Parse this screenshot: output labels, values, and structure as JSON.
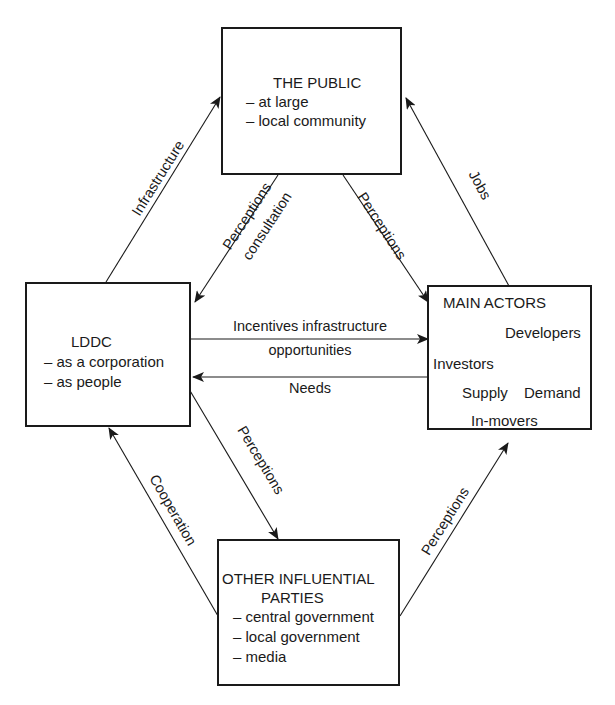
{
  "diagram": {
    "nodes": {
      "public": {
        "title": "THE PUBLIC",
        "items": [
          "– at large",
          "– local community"
        ]
      },
      "lddc": {
        "title": "LDDC",
        "items": [
          "– as a corporation",
          "– as people"
        ]
      },
      "main_actors": {
        "title": "MAIN ACTORS",
        "developers": "Developers",
        "investors": "Investors",
        "supply": "Supply",
        "demand": "Demand",
        "in_movers": "In-movers"
      },
      "other": {
        "title_line1": "OTHER INFLUENTIAL",
        "title_line2": "PARTIES",
        "items": [
          "– central government",
          "– local government",
          "– media"
        ]
      }
    },
    "edges": {
      "infrastructure": "Infrastructure",
      "jobs": "Jobs",
      "perceptions_consultation_1": "Perceptions",
      "perceptions_consultation_2": "consultation",
      "public_to_actors": "Perceptions",
      "incentives_1": "Incentives infrastructure",
      "incentives_2": "opportunities",
      "needs": "Needs",
      "lddc_to_other": "Perceptions",
      "cooperation": "Cooperation",
      "other_to_actors": "Perceptions"
    }
  }
}
